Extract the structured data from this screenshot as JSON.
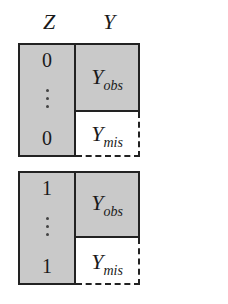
{
  "headers": {
    "z": "Z",
    "y": "Y"
  },
  "blocks": [
    {
      "z_top": "0",
      "z_bottom": "0",
      "y_obs": {
        "base": "Y",
        "sub": "obs"
      },
      "y_mis": {
        "base": "Y",
        "sub": "mis"
      }
    },
    {
      "z_top": "1",
      "z_bottom": "1",
      "y_obs": {
        "base": "Y",
        "sub": "obs"
      },
      "y_mis": {
        "base": "Y",
        "sub": "mis"
      }
    }
  ],
  "colors": {
    "observed_fill": "#c9c9c9",
    "border": "#222222",
    "missing_fill": "#ffffff"
  }
}
